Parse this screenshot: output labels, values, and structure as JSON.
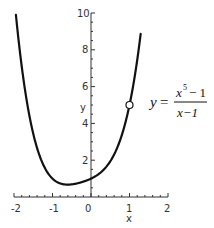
{
  "chart_data": {
    "type": "line",
    "title": "",
    "function": "y = (x^5 - 1)/(x - 1)",
    "equation_label": {
      "lhs": "y",
      "equals": "=",
      "numerator": "x",
      "numerator_exp": "5",
      "numerator_rest": "− 1",
      "denominator": "x−1"
    },
    "xlabel": "x",
    "ylabel": "y",
    "xlim": [
      -2,
      2
    ],
    "ylim": [
      0,
      10
    ],
    "x_ticks": [
      "-2",
      "-1",
      "0",
      "1",
      "2"
    ],
    "y_ticks": [
      "2",
      "4",
      "6",
      "8",
      "10"
    ],
    "grid": false,
    "series": [
      {
        "name": "y = (x^5-1)/(x-1)",
        "x": [
          -1.95,
          -1.8,
          -1.6,
          -1.4,
          -1.2,
          -1.0,
          -0.8,
          -0.6,
          -0.4,
          -0.2,
          0.0,
          0.2,
          0.4,
          0.6,
          0.8,
          1.0,
          1.2
        ],
        "y": [
          9.9,
          7.42,
          5.11,
          3.47,
          2.35,
          1.0,
          0.74,
          0.67,
          0.74,
          0.83,
          1.0,
          1.25,
          1.65,
          2.31,
          3.36,
          5.0,
          10.0
        ]
      }
    ],
    "annotations": [
      {
        "type": "open-circle",
        "x": 1,
        "y": 5,
        "meaning": "removable discontinuity (hole)"
      }
    ]
  },
  "axes": {
    "x_label": "x",
    "y_label": "y",
    "x_tick_labels": [
      "-2",
      "-1",
      "0",
      "1",
      "2"
    ],
    "y_tick_labels": [
      "2",
      "4",
      "6",
      "8",
      "10"
    ]
  },
  "equation": {
    "lhs": "y",
    "equals": "=",
    "num_base": "x",
    "num_exp": "5",
    "num_rest": "− 1",
    "den": "x−1"
  },
  "colors": {
    "curve": "#111111",
    "axis": "#333333",
    "background": "#ffffff"
  }
}
